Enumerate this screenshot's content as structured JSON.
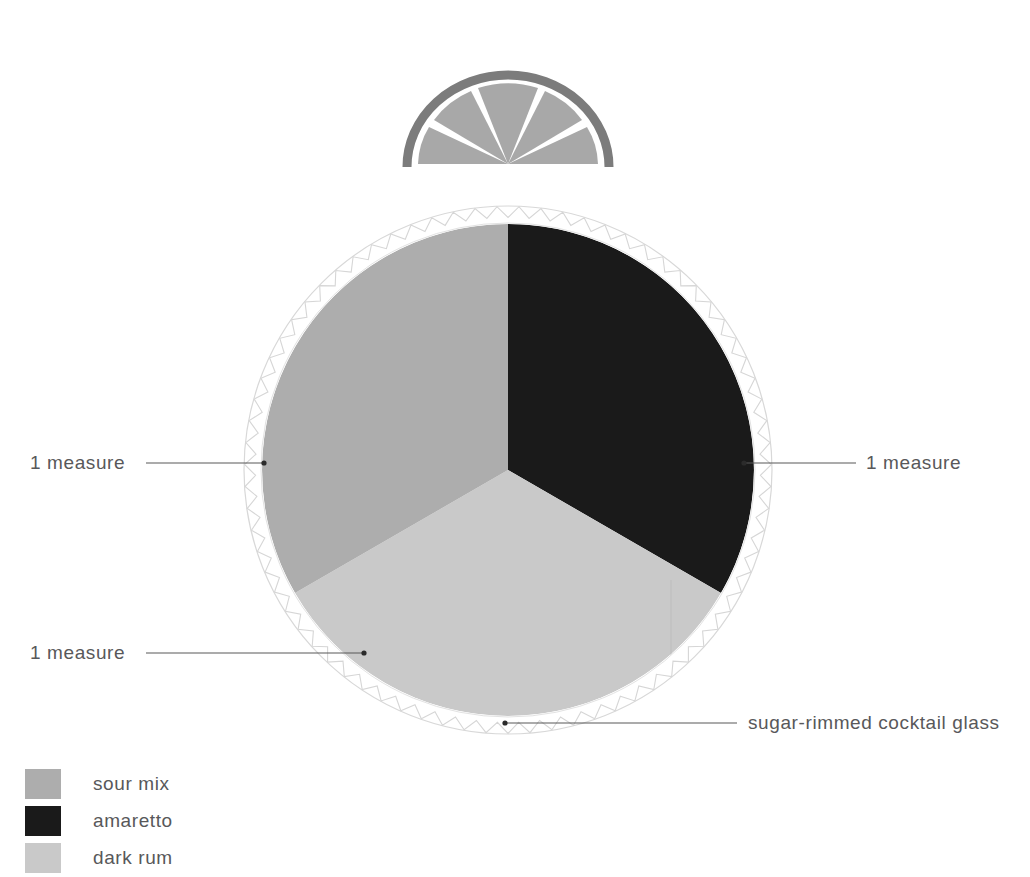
{
  "figure": {
    "background": "#ffffff"
  },
  "colors": {
    "sour_mix": "#adadad",
    "amaretto": "#1a1a1a",
    "dark_rum": "#c9c9c9",
    "rind": "#7c7c7c",
    "citrus_flesh": "#a8a8a8",
    "leader_line": "#585858",
    "rim_outline": "#d6d6d6",
    "text": "#58585a"
  },
  "chart_data": {
    "type": "pie",
    "xlabel": "",
    "ylabel": "",
    "legend_position": "bottom-left",
    "grid": false,
    "unit": "measure",
    "categories": [
      "sour mix",
      "amaretto",
      "dark rum"
    ],
    "values": [
      1,
      1,
      1
    ],
    "percentages": [
      33.3,
      33.3,
      33.3
    ],
    "slice_colors": [
      "#adadad",
      "#1a1a1a",
      "#c9c9c9"
    ],
    "start_angle_deg": 0,
    "slices": [
      {
        "name": "amaretto",
        "value": 1,
        "value_label": "1 measure",
        "color": "#1a1a1a",
        "start_deg": 0,
        "end_deg": 120
      },
      {
        "name": "dark rum",
        "value": 1,
        "value_label": "1 measure",
        "color": "#c9c9c9",
        "start_deg": 120,
        "end_deg": 240
      },
      {
        "name": "sour mix",
        "value": 1,
        "value_label": "1 measure",
        "color": "#adadad",
        "start_deg": 240,
        "end_deg": 360
      }
    ]
  },
  "callouts": {
    "left_top": "1 measure",
    "left_bottom": "1 measure",
    "right": "1 measure",
    "glass": "sugar-rimmed cocktail glass"
  },
  "legend": {
    "items": [
      {
        "label": "sour mix",
        "color": "#adadad"
      },
      {
        "label": "amaretto",
        "color": "#1a1a1a"
      },
      {
        "label": "dark rum",
        "color": "#c9c9c9"
      }
    ]
  },
  "garnish": {
    "name": "citrus half slice",
    "segments": 5,
    "rind_color": "#7c7c7c",
    "flesh_color": "#a8a8a8"
  }
}
